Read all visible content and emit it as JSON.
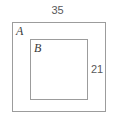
{
  "diagram": {
    "type": "nested-rectangles",
    "canvas": {
      "width": 115,
      "height": 120,
      "background": "#ffffff"
    },
    "stroke_color": "#9c9c9c",
    "text_color": "#58585a",
    "label_color": "#3a3a3a",
    "shapes": [
      {
        "id": "outer",
        "name": "A",
        "label": "A",
        "role": "outer-rectangle",
        "x": 12,
        "y": 22,
        "width": 94,
        "height": 90
      },
      {
        "id": "inner",
        "name": "B",
        "label": "B",
        "role": "inner-rectangle",
        "x": 30,
        "y": 39,
        "width": 58,
        "height": 61
      }
    ],
    "dimensions": {
      "top_width": "35",
      "right_height": "21"
    }
  },
  "chart_data": {
    "type": "diagram",
    "title": "",
    "categories": [
      "A",
      "B"
    ],
    "values": [
      35,
      21
    ],
    "annotations": [
      "35",
      "21",
      "A",
      "B"
    ]
  }
}
